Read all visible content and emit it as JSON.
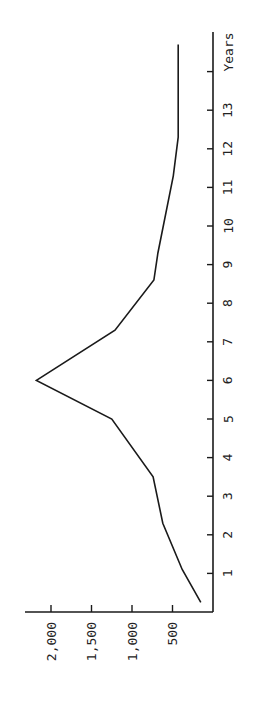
{
  "chart_data": {
    "type": "line",
    "orientation": "rotated-90-ccw",
    "title": "",
    "xlabel": "Years",
    "ylabel": "",
    "xlim": [
      0,
      15
    ],
    "ylim": [
      0,
      2300
    ],
    "x_ticks": [
      1,
      2,
      3,
      4,
      5,
      6,
      7,
      8,
      9,
      10,
      11,
      12,
      13,
      14
    ],
    "x_tick_labels": [
      "1",
      "2",
      "3",
      "4",
      "5",
      "6",
      "7",
      "8",
      "9",
      "10",
      "11",
      "12",
      "13",
      ""
    ],
    "y_ticks": [
      500,
      1000,
      1500,
      2000
    ],
    "y_tick_labels": [
      "500",
      "1,000",
      "1,500",
      "2,000"
    ],
    "grid": false,
    "legend": null,
    "series": [
      {
        "name": "series",
        "x": [
          0.25,
          1.1,
          2.3,
          3.5,
          5.0,
          6.0,
          7.3,
          8.6,
          9.3,
          11.3,
          12.3,
          14.7
        ],
        "values": [
          150,
          380,
          620,
          740,
          1250,
          2180,
          1210,
          730,
          680,
          490,
          430,
          430
        ]
      }
    ]
  }
}
